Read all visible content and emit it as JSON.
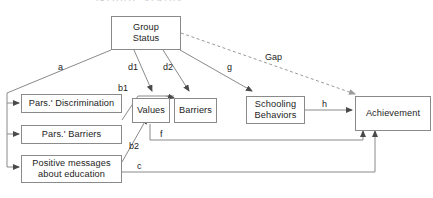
{
  "figure": {
    "type": "path-diagram",
    "cut_off_title": "Group Status",
    "background_color": "#ffffff",
    "line_color": "#8a8a8a",
    "text_color": "#1d1d1d"
  },
  "nodes": [
    {
      "id": "group_status",
      "label": "Group\nStatus"
    },
    {
      "id": "pars_discrimination",
      "label": "Pars.' Discrimination"
    },
    {
      "id": "pars_barriers",
      "label": "Pars.' Barriers"
    },
    {
      "id": "positive_messages",
      "label": "Positive messages\nabout education"
    },
    {
      "id": "values",
      "label": "Values"
    },
    {
      "id": "barriers",
      "label": "Barriers"
    },
    {
      "id": "schooling_behaviors",
      "label": "Schooling\nBehaviors"
    },
    {
      "id": "achievement",
      "label": "Achievement"
    }
  ],
  "edges": [
    {
      "id": "a",
      "label": "a",
      "from": "group_status",
      "to": "pars_discrimination, pars_barriers, positive_messages",
      "style": "solid"
    },
    {
      "id": "d1",
      "label": "d1",
      "from": "group_status",
      "to": "values",
      "style": "solid"
    },
    {
      "id": "d2",
      "label": "d2",
      "from": "group_status",
      "to": "barriers",
      "style": "solid"
    },
    {
      "id": "g",
      "label": "g",
      "from": "group_status",
      "to": "schooling_behaviors",
      "style": "solid"
    },
    {
      "id": "gap",
      "label": "Gap",
      "from": "group_status",
      "to": "achievement",
      "style": "dashed"
    },
    {
      "id": "b1",
      "label": "b1",
      "from": "pars_discrimination",
      "to": "values",
      "style": "solid"
    },
    {
      "id": "b2",
      "label": "b2",
      "from": "positive_messages",
      "to": "values",
      "style": "solid"
    },
    {
      "id": "f",
      "label": "f",
      "from": "values",
      "to": "achievement",
      "style": "solid"
    },
    {
      "id": "c",
      "label": "c",
      "from": "positive_messages",
      "to": "achievement",
      "style": "solid"
    },
    {
      "id": "h",
      "label": "h",
      "from": "schooling_behaviors",
      "to": "achievement",
      "style": "solid"
    }
  ]
}
